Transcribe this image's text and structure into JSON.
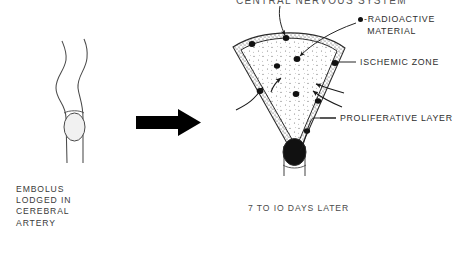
{
  "figure": {
    "kind": "medical-illustration",
    "title_top": "CENTRAL NERVOUS SYSTEM",
    "panels": [
      {
        "id": "left-panel",
        "caption": "EMBOLUS\nLODGED IN\nCEREBRAL\nARTERY",
        "caption_lines": [
          "EMBOLUS",
          "LODGED IN",
          "CEREBRAL",
          "ARTERY"
        ],
        "depicts": "cerebral artery with embolus lodged in lumen"
      },
      {
        "id": "right-panel",
        "caption": "7 TO IO DAYS LATER",
        "depicts": "wedge shaped infarct with proliferative layer and radioactive material"
      }
    ],
    "transition_arrow": {
      "direction": "right",
      "color": "#000000"
    },
    "labels": [
      {
        "id": "radioactive-material",
        "text": "-RADIOACTIVE\n MATERIAL",
        "line1": "-RADIOACTIVE",
        "line2": "MATERIAL",
        "has_dot_key": true
      },
      {
        "id": "ischemic-zone",
        "text": "ISCHEMIC ZONE"
      },
      {
        "id": "proliferative-layer",
        "text": "PROLIFERATIVE LAYER"
      }
    ],
    "colors": {
      "ink": "#1a1a1a",
      "text": "#3a3a3a",
      "stipple": "#6b6b6b",
      "fill": "#ffffff"
    }
  }
}
